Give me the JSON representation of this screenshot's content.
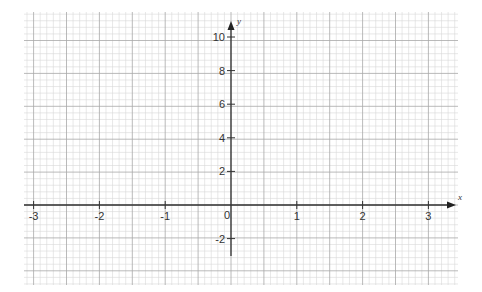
{
  "chart_data": {
    "type": "line",
    "title": "",
    "xlabel": "x",
    "ylabel": "y",
    "xlim": [
      -3.15,
      3.4
    ],
    "ylim": [
      -4.8,
      11.5
    ],
    "grid": true,
    "legend": null,
    "x_ticks": [
      -3,
      -2,
      -1,
      0,
      1,
      2,
      3
    ],
    "x_tick_labels": [
      "-3",
      "-2",
      "-1",
      "0",
      "1",
      "2",
      "3"
    ],
    "y_ticks": [
      -2,
      2,
      4,
      6,
      8,
      10
    ],
    "y_tick_labels": [
      "-2",
      "2",
      "4",
      "6",
      "8",
      "10"
    ],
    "series": []
  },
  "axes": {
    "x_name": "x",
    "y_name": "y",
    "origin_label": "0"
  },
  "colors": {
    "minor_grid": "#d8d8d8",
    "major_grid": "#a8a8a8",
    "axis": "#333333"
  }
}
